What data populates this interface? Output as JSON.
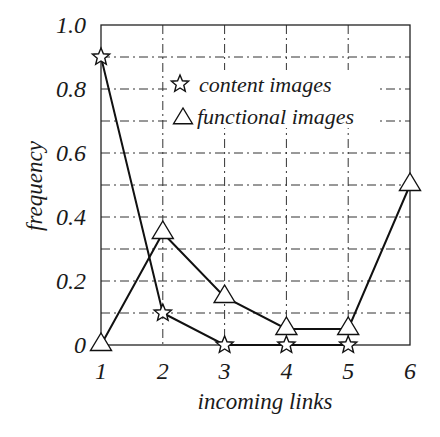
{
  "chart_data": {
    "type": "line",
    "title": "",
    "xlabel": "incoming links",
    "ylabel": "frequency",
    "x": [
      1,
      2,
      3,
      4,
      5,
      6
    ],
    "xticks": [
      "1",
      "2",
      "3",
      "4",
      "5",
      "6"
    ],
    "yticks": [
      "0",
      "0.2",
      "0.4",
      "0.6",
      "0.8",
      "1.0"
    ],
    "xlim": [
      1,
      6
    ],
    "ylim": [
      0,
      1.0
    ],
    "grid": true,
    "grid_step_y": 0.1,
    "legend_position": "upper center",
    "series": [
      {
        "name": "content images",
        "marker": "star",
        "x": [
          1,
          2,
          3,
          4,
          5
        ],
        "values": [
          0.9,
          0.1,
          0.0,
          0.0,
          0.0
        ]
      },
      {
        "name": "functional images",
        "marker": "triangle",
        "x": [
          1,
          2,
          3,
          4,
          5,
          6
        ],
        "values": [
          0.0,
          0.35,
          0.15,
          0.05,
          0.05,
          0.5
        ]
      }
    ]
  }
}
